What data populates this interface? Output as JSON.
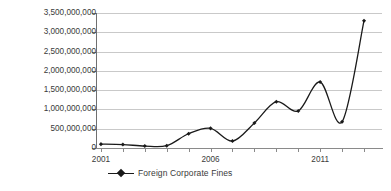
{
  "chart_data": {
    "type": "line",
    "title": "",
    "xlabel": "",
    "ylabel": "",
    "grid": true,
    "legend_position": "bottom",
    "categories": [
      "2001",
      "2002",
      "2003",
      "2004",
      "2005",
      "2006",
      "2007",
      "2008",
      "2009",
      "2010",
      "2011",
      "2012",
      "2013"
    ],
    "x_tick_labels": [
      "2001",
      "",
      "",
      "",
      "",
      "2006",
      "",
      "",
      "",
      "",
      "2011",
      "",
      ""
    ],
    "y_tick_labels": [
      "0",
      "500,000,000",
      "1,000,000,000",
      "1,500,000,000",
      "2,000,000,000",
      "2,500,000,000",
      "3,000,000,000",
      "3,500,000,000"
    ],
    "ylim": [
      0,
      3500000000
    ],
    "y_tick_step": 500000000,
    "series": [
      {
        "name": "Foreign Corporate Fines",
        "color": "#1a1a1a",
        "marker": "diamond",
        "values": [
          100000000,
          90000000,
          50000000,
          60000000,
          370000000,
          510000000,
          180000000,
          650000000,
          1200000000,
          960000000,
          1710000000,
          680000000,
          3300000000
        ]
      }
    ]
  },
  "legend": {
    "entries": [
      {
        "label": "Foreign Corporate Fines"
      }
    ]
  }
}
